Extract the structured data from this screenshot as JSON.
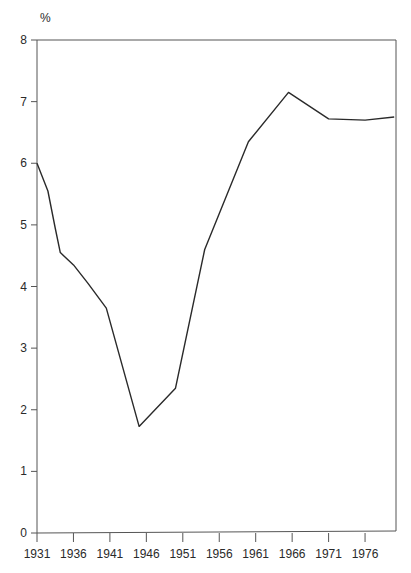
{
  "chart_data": {
    "type": "line",
    "title": "",
    "xlabel": "",
    "ylabel": "%",
    "ylim": [
      0,
      8
    ],
    "xlim": [
      1931,
      1980
    ],
    "grid": false,
    "legend": null,
    "y_ticks": [
      "0",
      "1",
      "2",
      "3",
      "4",
      "5",
      "6",
      "7",
      "8"
    ],
    "x_ticks": [
      "1931",
      "1936",
      "1941",
      "1946",
      "1951",
      "1956",
      "1961",
      "1966",
      "1971",
      "1976"
    ],
    "series": [
      {
        "name": "%",
        "x": [
          1931,
          1932.5,
          1933.5,
          1934.2,
          1936,
          1938,
          1940.5,
          1945,
          1950,
          1954,
          1960,
          1965.5,
          1971,
          1976,
          1980
        ],
        "values": [
          6.0,
          5.55,
          4.95,
          4.55,
          4.35,
          4.05,
          3.65,
          1.73,
          2.35,
          4.6,
          6.35,
          7.15,
          6.72,
          6.7,
          6.75
        ]
      }
    ],
    "colors": {
      "line": "#2a2a2a",
      "axis": "#555555"
    }
  }
}
